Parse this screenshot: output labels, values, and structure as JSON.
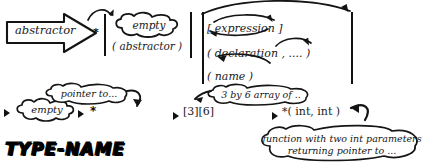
{
  "colors": {
    "ink": "#111111",
    "paper": "#ffffff"
  },
  "production": {
    "lhs_label": "abstractor",
    "star_symbol": "*",
    "alternatives": [
      {
        "id": "empty",
        "label": "empty",
        "kind": "cloud"
      },
      {
        "id": "paren-abstractor",
        "label": "( abstractor )",
        "kind": "text"
      },
      {
        "id": "subscript",
        "label": "[ expression ]",
        "kind": "text"
      },
      {
        "id": "param-list",
        "label": "( declaration , .... )",
        "kind": "text"
      },
      {
        "id": "name",
        "label": "( name )",
        "kind": "text"
      }
    ],
    "group_rows": [
      {
        "open": "[",
        "item": "expression",
        "close": "]"
      },
      {
        "open": "(",
        "item": "declaration",
        "sep": ", ....",
        "close": ")"
      },
      {
        "open": "(",
        "item": "name",
        "close": ")"
      }
    ]
  },
  "examples": {
    "empty_example": {
      "bullet": "▶",
      "cloud_label": "empty"
    },
    "pointer_example": {
      "bullet": "▶",
      "token": "*",
      "cloud_label": "pointer to..."
    },
    "array_example": {
      "bullet": "▶",
      "token": "[3][6]",
      "cloud_label": "3 by 6 array of .."
    },
    "function_example": {
      "bullet": "▶",
      "token": "*( int, int )",
      "cloud_label_line1": "function with two int parameters",
      "cloud_label_line2": "returning pointer to ..."
    }
  },
  "footer": {
    "type_name_title": "TYPE-NAME"
  }
}
